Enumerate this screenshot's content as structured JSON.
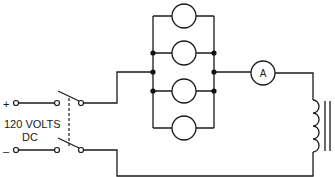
{
  "diagram": {
    "type": "circuit-schematic",
    "source": {
      "label_line1": "120 VOLTS",
      "label_line2": "DC",
      "positive_sign": "+",
      "negative_sign": "–"
    },
    "switch": {
      "type": "double-pole single-throw",
      "linkage": "dashed"
    },
    "load": {
      "description": "four lamps in parallel",
      "lamp_count": 4
    },
    "meter": {
      "symbol": "A",
      "name": "ammeter"
    },
    "inductor": {
      "name": "iron-core coil"
    },
    "colors": {
      "line": "#1a1a1a",
      "background": "#ffffff"
    }
  }
}
